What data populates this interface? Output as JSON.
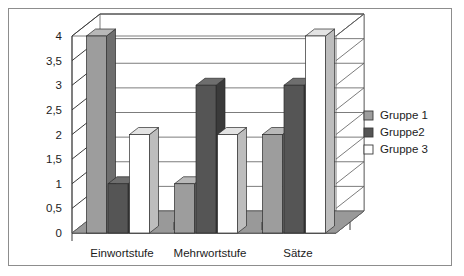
{
  "chart_data": {
    "type": "bar",
    "title": "",
    "subtitle": "",
    "xlabel": "",
    "ylabel": "",
    "categories": [
      "Einwortstufe",
      "Mehrwortstufe",
      "Sätze"
    ],
    "series": [
      {
        "name": "Gruppe 1",
        "values": [
          4,
          1,
          2
        ],
        "color": "#9d9d9d"
      },
      {
        "name": "Gruppe2",
        "values": [
          1,
          3,
          3
        ],
        "color": "#555555"
      },
      {
        "name": "Gruppe 3",
        "values": [
          2,
          2,
          4
        ],
        "color": "#ffffff"
      }
    ],
    "ylim": [
      0,
      4
    ],
    "ytick_values": [
      0,
      0.5,
      1,
      1.5,
      2,
      2.5,
      3,
      3.5,
      4
    ],
    "ytick_labels": [
      "0",
      "0,5",
      "1",
      "1,5",
      "2",
      "2,5",
      "3",
      "3,5",
      "4"
    ],
    "grid": true,
    "three_d": true,
    "legend_position": "right",
    "legend_border": false
  },
  "legend": {
    "items": [
      {
        "label": "Gruppe 1",
        "swatch": "#9d9d9d"
      },
      {
        "label": "Gruppe2",
        "swatch": "#555555"
      },
      {
        "label": "Gruppe 3",
        "swatch": "#ffffff"
      }
    ]
  },
  "colors": {
    "frame_border": "#8d8d8d",
    "plot_background": "#ffffff",
    "floor": "#999999",
    "gridline": "#5a5a5a",
    "axis": "#3a3a3a",
    "bar_group1_front": "#9d9d9d",
    "bar_group1_side": "#6e6e6e",
    "bar_group1_top": "#b8b8b8",
    "bar_group2_front": "#555555",
    "bar_group2_side": "#3a3a3a",
    "bar_group2_top": "#6e6e6e",
    "bar_group3_front": "#ffffff",
    "bar_group3_side": "#bdbdbd",
    "bar_group3_top": "#e3e3e3"
  }
}
